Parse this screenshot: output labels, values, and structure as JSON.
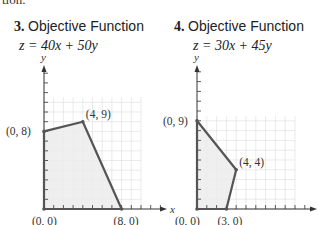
{
  "cut_text": "tion.",
  "problems": [
    {
      "number": "3.",
      "heading": "Objective Function",
      "equation": "z = 40x + 50y"
    },
    {
      "number": "4.",
      "heading": "Objective Function",
      "equation": "z = 30x + 45y"
    }
  ],
  "colors": {
    "region_fill": "#ececec",
    "boundary": "#555555",
    "grid": "#dcdcdc",
    "axis": "#333333"
  },
  "chart_data": [
    {
      "type": "area",
      "title": "Objective Function z = 40x + 50y",
      "xlabel": "x",
      "ylabel": "y",
      "grid": true,
      "xlim": [
        0,
        12
      ],
      "ylim": [
        0,
        12
      ],
      "vertices": [
        [
          0,
          0
        ],
        [
          0,
          8
        ],
        [
          4,
          9
        ],
        [
          8,
          0
        ]
      ],
      "vertex_labels": [
        "(0, 0)",
        "(0, 8)",
        "(4, 9)",
        "(8, 0)"
      ]
    },
    {
      "type": "area",
      "title": "Objective Function z = 30x + 45y",
      "xlabel": "x",
      "ylabel": "y",
      "grid": true,
      "xlim": [
        0,
        10
      ],
      "ylim": [
        0,
        12
      ],
      "vertices": [
        [
          0,
          0
        ],
        [
          0,
          9
        ],
        [
          4,
          4
        ],
        [
          3,
          0
        ]
      ],
      "vertex_labels": [
        "(0, 0)",
        "(0, 9)",
        "(4, 4)",
        "(3, 0)"
      ]
    }
  ]
}
